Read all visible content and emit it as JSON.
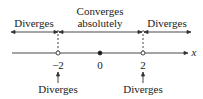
{
  "diagram": {
    "type": "number-line",
    "axis_label": "x",
    "regions": [
      {
        "label": "Diverges",
        "position": "left"
      },
      {
        "label_line1": "Converges",
        "label_line2": "absolutely",
        "position": "middle"
      },
      {
        "label": "Diverges",
        "position": "right"
      }
    ],
    "points": [
      {
        "value": "−2",
        "marker": "open-circle",
        "note": "Diverges"
      },
      {
        "value": "0",
        "marker": "filled-dot"
      },
      {
        "value": "2",
        "marker": "open-circle",
        "note": "Diverges"
      }
    ]
  }
}
